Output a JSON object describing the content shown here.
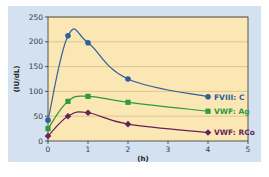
{
  "chart_data": {
    "type": "line",
    "title": "",
    "xlabel": "(h)",
    "ylabel": "(IU/dL)",
    "xlim": [
      0,
      5
    ],
    "ylim": [
      0,
      250
    ],
    "x_ticks": [
      0,
      1,
      2,
      3,
      4,
      5
    ],
    "y_ticks": [
      0,
      50,
      100,
      150,
      200,
      250
    ],
    "grid": "horizontal",
    "legend_position": "inline-right-of-last-point",
    "x": [
      0,
      0.5,
      1,
      2,
      4
    ],
    "series": [
      {
        "name": "FVIII: C",
        "marker": "circle",
        "color": "#2f5f9e",
        "values": [
          42,
          212,
          198,
          125,
          89
        ],
        "label_color": "#2f5f9e"
      },
      {
        "name": "VWF: Ag",
        "marker": "square",
        "color": "#2e9a3c",
        "values": [
          25,
          80,
          90,
          78,
          60
        ],
        "label_color": "#2e9a3c"
      },
      {
        "name": "VWF: RCo",
        "marker": "diamond",
        "color": "#6a1f5c",
        "values": [
          10,
          50,
          57,
          34,
          17
        ],
        "label_color": "#6a1f5c"
      }
    ],
    "colors": {
      "panel_background": "#d3e1f1",
      "plot_background": "#fbe7b3",
      "gridline": "#c9b27a",
      "axis": "#333333"
    }
  }
}
